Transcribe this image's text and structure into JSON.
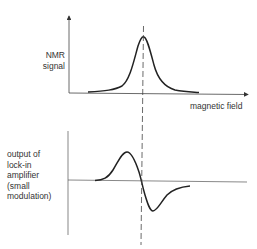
{
  "top_plot": {
    "ylabel_lines": [
      "NMR",
      "signal"
    ],
    "xlabel": "magnetic field",
    "curve_type": "absorption lineshape (Lorentzian peak)"
  },
  "bottom_plot": {
    "ylabel_lines": [
      "output of",
      "lock-in",
      "amplifier",
      "(small",
      "modulation)"
    ],
    "curve_type": "derivative lineshape"
  },
  "guide": {
    "style": "dashed vertical line through resonance centre"
  },
  "colors": {
    "ink": "#333333",
    "background": "#ffffff"
  }
}
